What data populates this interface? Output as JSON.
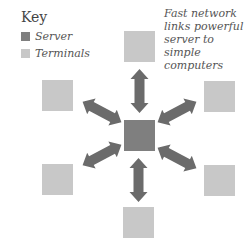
{
  "key": {
    "title": "Key",
    "items": [
      {
        "label": "Server",
        "color": "#7f7f7f"
      },
      {
        "label": "Terminals",
        "color": "#c8c8c8"
      }
    ]
  },
  "caption": "Fast network links powerful server to simple computers",
  "colors": {
    "server": "#7f7f7f",
    "terminal": "#c8c8c8",
    "arrow": "#6e6e6e"
  },
  "nodes": {
    "server": {
      "x": 124,
      "y": 120
    },
    "terminals": [
      {
        "x": 124,
        "y": 31
      },
      {
        "x": 42,
        "y": 80
      },
      {
        "x": 204,
        "y": 81
      },
      {
        "x": 42,
        "y": 164
      },
      {
        "x": 204,
        "y": 165
      },
      {
        "x": 123,
        "y": 207
      }
    ]
  }
}
